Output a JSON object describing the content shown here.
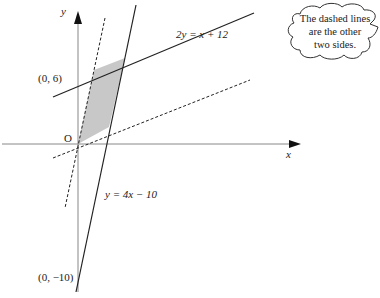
{
  "diagram": {
    "axes": {
      "x_label": "x",
      "y_label": "y",
      "origin_label": "O"
    },
    "lines": [
      {
        "label": "2y = x + 12",
        "style": "solid"
      },
      {
        "label": "y = 4x − 10",
        "style": "solid"
      },
      {
        "label": "",
        "style": "dashed"
      },
      {
        "label": "",
        "style": "dashed"
      }
    ],
    "points": [
      {
        "label": "(0, 6)"
      },
      {
        "label": "(0, −10)"
      }
    ],
    "shaded_region": "parallelogram",
    "colors": {
      "shade": "#c8c8c8",
      "line": "#222222",
      "axis": "#888888"
    },
    "callout": {
      "line1": "The dashed lines",
      "line2": "are the other",
      "line3": "two sides."
    }
  }
}
